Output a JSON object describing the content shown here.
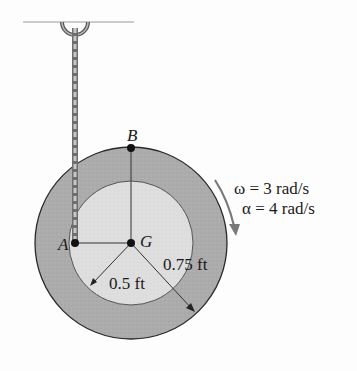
{
  "diagram": {
    "points": {
      "A": "A",
      "B": "B",
      "G": "G"
    },
    "dimensions": {
      "inner_radius": "0.5 ft",
      "outer_radius": "0.75 ft"
    },
    "kinematics": {
      "omega": "ω = 3 rad/s",
      "alpha": "α = 4 rad/s"
    },
    "colors": {
      "outer_ring": "#a9a9a9",
      "inner_disk": "#dcdcdc",
      "outline": "#2a2a2a",
      "rope": "#8a8a8a",
      "arrow": "#7a7a7a",
      "ceiling": "#9a9a9a"
    }
  }
}
